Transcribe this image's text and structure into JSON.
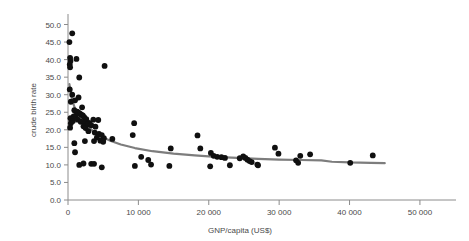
{
  "chart_data": {
    "type": "scatter",
    "title": "",
    "xlabel": "GNP/capita (US$)",
    "ylabel": "crude birth rate",
    "xlim": [
      0,
      52000
    ],
    "ylim": [
      0,
      51
    ],
    "grid": false,
    "legend": "none",
    "xticks": [
      0,
      10000,
      20000,
      30000,
      40000,
      50000
    ],
    "xtick_labels": [
      "0",
      "10 000",
      "20 000",
      "30 000",
      "40 000",
      "50 000"
    ],
    "yticks": [
      0,
      5,
      10,
      15,
      20,
      25,
      30,
      35,
      40,
      45,
      50
    ],
    "ytick_labels": [
      "0.0",
      "5.0",
      "10.0",
      "15.0",
      "20.0",
      "25.0",
      "30.0",
      "35.0",
      "40.0",
      "45.0",
      "50.0"
    ],
    "point_color": "#101010",
    "trend_color": "#7d7d7d",
    "axis_color": "#8c8c8c",
    "points": [
      [
        600,
        47.5
      ],
      [
        200,
        45.0
      ],
      [
        300,
        40.5
      ],
      [
        350,
        39.6
      ],
      [
        1200,
        40.2
      ],
      [
        250,
        38.6
      ],
      [
        300,
        37.8
      ],
      [
        5200,
        38.2
      ],
      [
        1600,
        34.9
      ],
      [
        250,
        31.5
      ],
      [
        600,
        30.0
      ],
      [
        1500,
        29.2
      ],
      [
        1000,
        28.4
      ],
      [
        400,
        28.0
      ],
      [
        2000,
        26.4
      ],
      [
        900,
        25.6
      ],
      [
        1300,
        25.2
      ],
      [
        1500,
        24.9
      ],
      [
        1700,
        24.6
      ],
      [
        1900,
        24.3
      ],
      [
        2100,
        24.1
      ],
      [
        1100,
        24.0
      ],
      [
        800,
        23.8
      ],
      [
        2300,
        23.6
      ],
      [
        350,
        23.3
      ],
      [
        500,
        23.0
      ],
      [
        1400,
        22.9
      ],
      [
        2600,
        23.0
      ],
      [
        3600,
        22.9
      ],
      [
        4300,
        22.8
      ],
      [
        700,
        22.5
      ],
      [
        1800,
        22.3
      ],
      [
        2400,
        22.2
      ],
      [
        3000,
        22.0
      ],
      [
        400,
        21.9
      ],
      [
        2800,
        21.6
      ],
      [
        3300,
        21.3
      ],
      [
        2200,
        21.0
      ],
      [
        3900,
        20.9
      ],
      [
        300,
        20.6
      ],
      [
        2500,
        20.5
      ],
      [
        9400,
        21.9
      ],
      [
        2900,
        19.6
      ],
      [
        3800,
        19.2
      ],
      [
        4400,
        18.8
      ],
      [
        4800,
        18.5
      ],
      [
        9200,
        18.5
      ],
      [
        18400,
        18.4
      ],
      [
        4100,
        17.8
      ],
      [
        5100,
        17.6
      ],
      [
        6300,
        17.4
      ],
      [
        4600,
        16.9
      ],
      [
        3700,
        16.8
      ],
      [
        2400,
        16.8
      ],
      [
        900,
        16.2
      ],
      [
        5000,
        16.6
      ],
      [
        14600,
        14.7
      ],
      [
        18800,
        14.7
      ],
      [
        29400,
        14.9
      ],
      [
        29900,
        13.2
      ],
      [
        33000,
        12.6
      ],
      [
        34400,
        13.0
      ],
      [
        43300,
        12.7
      ],
      [
        1000,
        13.6
      ],
      [
        20300,
        13.4
      ],
      [
        20700,
        12.6
      ],
      [
        21200,
        12.3
      ],
      [
        21800,
        12.2
      ],
      [
        22300,
        12.0
      ],
      [
        24400,
        11.9
      ],
      [
        24900,
        12.4
      ],
      [
        25200,
        12.0
      ],
      [
        25500,
        11.5
      ],
      [
        25800,
        11.1
      ],
      [
        26100,
        10.8
      ],
      [
        32400,
        11.3
      ],
      [
        32700,
        10.6
      ],
      [
        40100,
        10.6
      ],
      [
        10400,
        12.3
      ],
      [
        9500,
        9.7
      ],
      [
        11400,
        11.4
      ],
      [
        11800,
        10.1
      ],
      [
        14400,
        9.7
      ],
      [
        1600,
        10.0
      ],
      [
        2200,
        10.4
      ],
      [
        3300,
        10.3
      ],
      [
        3700,
        10.3
      ],
      [
        4800,
        9.3
      ],
      [
        20200,
        9.6
      ],
      [
        23000,
        9.9
      ],
      [
        26900,
        10.1
      ],
      [
        27000,
        9.9
      ]
    ],
    "trend_line": [
      [
        200,
        33.0
      ],
      [
        400,
        30.5
      ],
      [
        700,
        27.8
      ],
      [
        1000,
        26.0
      ],
      [
        1400,
        24.6
      ],
      [
        1900,
        23.2
      ],
      [
        2400,
        22.0
      ],
      [
        3000,
        20.6
      ],
      [
        3800,
        19.2
      ],
      [
        4800,
        18.0
      ],
      [
        6000,
        16.9
      ],
      [
        7500,
        15.8
      ],
      [
        9500,
        14.8
      ],
      [
        12000,
        13.9
      ],
      [
        15000,
        13.2
      ],
      [
        18000,
        12.7
      ],
      [
        21000,
        12.3
      ],
      [
        24000,
        12.0
      ],
      [
        27000,
        11.7
      ],
      [
        30000,
        11.5
      ],
      [
        33000,
        11.4
      ],
      [
        36000,
        11.3
      ],
      [
        37500,
        10.9
      ],
      [
        40000,
        10.7
      ],
      [
        43000,
        10.6
      ],
      [
        45000,
        10.5
      ]
    ]
  }
}
